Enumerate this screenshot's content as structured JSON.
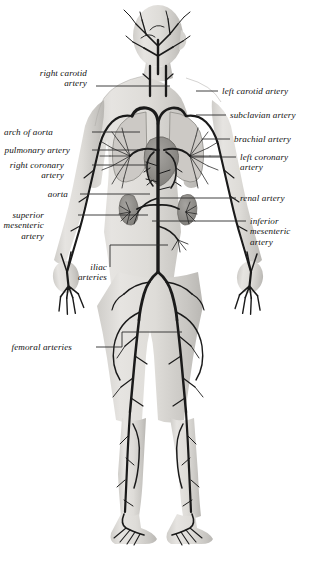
{
  "figure": {
    "colors": {
      "background": "#ffffff",
      "body_silhouette": "#d9d7d3",
      "body_shadow": "#b4b2ae",
      "artery": "#1a1a1a",
      "organ": "#8e8c88",
      "leader_line": "#2b2b2b",
      "label_text": "#111111"
    }
  },
  "labels": {
    "left": [
      {
        "id": "right-carotid-artery",
        "text": "right carotid\nartery",
        "x": 40,
        "y": 68,
        "leader": [
          [
            96,
            86
          ],
          [
            170,
            86
          ]
        ]
      },
      {
        "id": "arch-of-aorta",
        "text": "arch of aorta",
        "x": 4,
        "y": 127,
        "leader": [
          [
            92,
            132
          ],
          [
            140,
            132
          ]
        ]
      },
      {
        "id": "pulmonary-artery",
        "text": "pulmonary artery",
        "x": 4,
        "y": 145,
        "leader": [
          [
            92,
            150
          ],
          [
            143,
            150
          ]
        ]
      },
      {
        "id": "right-coronary-artery",
        "text": "right coronary\nartery",
        "x": 10,
        "y": 160,
        "leader": [
          [
            92,
            165
          ],
          [
            146,
            165
          ]
        ]
      },
      {
        "id": "aorta",
        "text": "aorta",
        "x": 48,
        "y": 189,
        "leader": [
          [
            80,
            194
          ],
          [
            150,
            194
          ]
        ]
      },
      {
        "id": "superior-mesenteric-artery",
        "text": "superior\nmesenteric\nartery",
        "x": 4,
        "y": 210,
        "leader": [
          [
            78,
            215
          ],
          [
            148,
            215
          ]
        ]
      },
      {
        "id": "iliac-arteries",
        "text": "iliac\narteries",
        "x": 78,
        "y": 262,
        "leader": [
          [
            110,
            267
          ],
          [
            110,
            245
          ],
          [
            168,
            245
          ]
        ]
      },
      {
        "id": "femoral-arteries",
        "text": "femoral arteries",
        "x": 12,
        "y": 342,
        "leader": [
          [
            96,
            347
          ],
          [
            122,
            347
          ],
          [
            122,
            332
          ],
          [
            182,
            332
          ]
        ]
      }
    ],
    "right": [
      {
        "id": "left-carotid-artery",
        "text": "left carotid artery",
        "x": 222,
        "y": 86,
        "leader": [
          [
            196,
            91
          ],
          [
            218,
            91
          ]
        ]
      },
      {
        "id": "subclavian-artery",
        "text": "subclavian artery",
        "x": 230,
        "y": 110,
        "leader": [
          [
            196,
            115
          ],
          [
            226,
            115
          ]
        ]
      },
      {
        "id": "brachial-artery",
        "text": "brachial artery",
        "x": 234,
        "y": 134,
        "leader": [
          [
            202,
            139
          ],
          [
            230,
            139
          ]
        ]
      },
      {
        "id": "left-coronary-artery",
        "text": "left coronary\nartery",
        "x": 240,
        "y": 152,
        "leader": [
          [
            190,
            157
          ],
          [
            236,
            157
          ]
        ]
      },
      {
        "id": "renal-artery",
        "text": "renal artery",
        "x": 240,
        "y": 193,
        "leader": [
          [
            160,
            198
          ],
          [
            236,
            198
          ]
        ]
      },
      {
        "id": "inferior-mesenteric-artery",
        "text": "inferior\nmesenteric\nartery",
        "x": 250,
        "y": 216,
        "leader": [
          [
            152,
            221
          ],
          [
            246,
            221
          ]
        ]
      }
    ]
  }
}
